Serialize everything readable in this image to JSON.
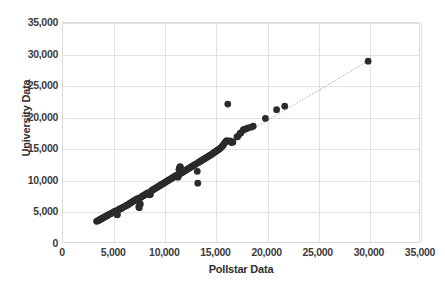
{
  "chart_data": {
    "type": "scatter",
    "title": "",
    "xlabel": "Pollstar Data",
    "ylabel": "University Data",
    "xlim": [
      0,
      35000
    ],
    "ylim": [
      0,
      35000
    ],
    "xticks": [
      0,
      5000,
      10000,
      15000,
      20000,
      25000,
      30000,
      35000
    ],
    "yticks": [
      0,
      5000,
      10000,
      15000,
      20000,
      25000,
      30000,
      35000
    ],
    "xtick_labels": [
      "0",
      "5,000",
      "10,000",
      "15,000",
      "20,000",
      "25,000",
      "30,000",
      "35,000"
    ],
    "ytick_labels": [
      "0",
      "5,000",
      "10,000",
      "15,000",
      "20,000",
      "25,000",
      "30,000",
      "35,000"
    ],
    "grid": true,
    "legend": "none",
    "marker_color": "#2b2b2b",
    "marker_size": 4.6,
    "gridline_color": "#e2e2e2",
    "background_color": "#ffffff",
    "trendline": {
      "style": "dotted",
      "color": "#9a9a9a",
      "x": [
        3300,
        30000
      ],
      "y": [
        3350,
        28900
      ]
    },
    "series": [
      {
        "name": "Venues",
        "points": [
          [
            3300,
            3300
          ],
          [
            3400,
            3380
          ],
          [
            3520,
            3450
          ],
          [
            3610,
            3560
          ],
          [
            3700,
            3640
          ],
          [
            3800,
            3720
          ],
          [
            3880,
            3800
          ],
          [
            3960,
            3880
          ],
          [
            4050,
            3960
          ],
          [
            4150,
            4050
          ],
          [
            4240,
            4130
          ],
          [
            4330,
            4200
          ],
          [
            4420,
            4300
          ],
          [
            4500,
            4380
          ],
          [
            4600,
            4460
          ],
          [
            4700,
            4540
          ],
          [
            4800,
            4620
          ],
          [
            4900,
            4700
          ],
          [
            5000,
            4800
          ],
          [
            5100,
            4880
          ],
          [
            5200,
            4960
          ],
          [
            5300,
            4400
          ],
          [
            5350,
            4350
          ],
          [
            5420,
            5100
          ],
          [
            5500,
            5200
          ],
          [
            5600,
            5280
          ],
          [
            5700,
            5360
          ],
          [
            5800,
            5440
          ],
          [
            5900,
            5540
          ],
          [
            6000,
            5620
          ],
          [
            6100,
            5700
          ],
          [
            6200,
            5800
          ],
          [
            6300,
            5880
          ],
          [
            6400,
            5960
          ],
          [
            6500,
            6100
          ],
          [
            6600,
            6200
          ],
          [
            6700,
            6300
          ],
          [
            6800,
            6400
          ],
          [
            6900,
            6500
          ],
          [
            7000,
            6600
          ],
          [
            7100,
            6700
          ],
          [
            7200,
            6800
          ],
          [
            7300,
            6900
          ],
          [
            7400,
            6980
          ],
          [
            7450,
            5600
          ],
          [
            7500,
            5480
          ],
          [
            7550,
            6200
          ],
          [
            7600,
            6050
          ],
          [
            7700,
            7200
          ],
          [
            7800,
            7300
          ],
          [
            7900,
            7400
          ],
          [
            8000,
            7500
          ],
          [
            8100,
            7600
          ],
          [
            8200,
            7700
          ],
          [
            8300,
            7800
          ],
          [
            8400,
            7900
          ],
          [
            8500,
            7550
          ],
          [
            8600,
            7600
          ],
          [
            8700,
            8200
          ],
          [
            8800,
            8300
          ],
          [
            8900,
            8400
          ],
          [
            9000,
            8500
          ],
          [
            9100,
            8600
          ],
          [
            9200,
            8700
          ],
          [
            9300,
            8800
          ],
          [
            9400,
            8900
          ],
          [
            9500,
            9000
          ],
          [
            9600,
            9100
          ],
          [
            9700,
            9200
          ],
          [
            9800,
            9300
          ],
          [
            9900,
            9400
          ],
          [
            10000,
            9500
          ],
          [
            10100,
            9600
          ],
          [
            10200,
            9700
          ],
          [
            10300,
            9800
          ],
          [
            10400,
            9900
          ],
          [
            10500,
            10000
          ],
          [
            10600,
            10100
          ],
          [
            10700,
            10200
          ],
          [
            10800,
            10300
          ],
          [
            10900,
            10400
          ],
          [
            11000,
            10500
          ],
          [
            11100,
            10600
          ],
          [
            11200,
            10700
          ],
          [
            11300,
            10350
          ],
          [
            11350,
            10500
          ],
          [
            11400,
            11600
          ],
          [
            11450,
            11800
          ],
          [
            11500,
            12050
          ],
          [
            11550,
            11950
          ],
          [
            11600,
            11000
          ],
          [
            11700,
            11100
          ],
          [
            11800,
            11200
          ],
          [
            11900,
            11300
          ],
          [
            12000,
            11400
          ],
          [
            12100,
            11500
          ],
          [
            12200,
            11600
          ],
          [
            12300,
            11700
          ],
          [
            12400,
            11800
          ],
          [
            12500,
            11900
          ],
          [
            12600,
            12000
          ],
          [
            12700,
            12100
          ],
          [
            12800,
            12200
          ],
          [
            12900,
            12300
          ],
          [
            13000,
            12400
          ],
          [
            13100,
            12500
          ],
          [
            13200,
            11300
          ],
          [
            13250,
            9400
          ],
          [
            13300,
            12700
          ],
          [
            13400,
            12800
          ],
          [
            13500,
            12900
          ],
          [
            13600,
            13000
          ],
          [
            13700,
            13100
          ],
          [
            13800,
            13200
          ],
          [
            13900,
            13300
          ],
          [
            14000,
            13400
          ],
          [
            14100,
            13500
          ],
          [
            14200,
            13600
          ],
          [
            14300,
            13700
          ],
          [
            14400,
            13800
          ],
          [
            14500,
            13900
          ],
          [
            14600,
            14000
          ],
          [
            14700,
            14100
          ],
          [
            14800,
            14250
          ],
          [
            14900,
            14350
          ],
          [
            15000,
            14450
          ],
          [
            15100,
            14550
          ],
          [
            15200,
            14700
          ],
          [
            15300,
            14800
          ],
          [
            15400,
            14900
          ],
          [
            15500,
            15050
          ],
          [
            15600,
            15200
          ],
          [
            15700,
            15400
          ],
          [
            15800,
            15600
          ],
          [
            15900,
            15850
          ],
          [
            16000,
            16050
          ],
          [
            16100,
            16200
          ],
          [
            16200,
            22050
          ],
          [
            16400,
            16150
          ],
          [
            16550,
            15900
          ],
          [
            16600,
            16000
          ],
          [
            16700,
            15950
          ],
          [
            17100,
            16800
          ],
          [
            17200,
            16900
          ],
          [
            17400,
            17350
          ],
          [
            17500,
            17450
          ],
          [
            17700,
            17900
          ],
          [
            17800,
            18000
          ],
          [
            17900,
            18050
          ],
          [
            18000,
            18100
          ],
          [
            18200,
            18250
          ],
          [
            18500,
            18350
          ],
          [
            18700,
            18500
          ],
          [
            19900,
            19750
          ],
          [
            21000,
            21150
          ],
          [
            21800,
            21700
          ],
          [
            30000,
            28900
          ]
        ]
      }
    ]
  }
}
